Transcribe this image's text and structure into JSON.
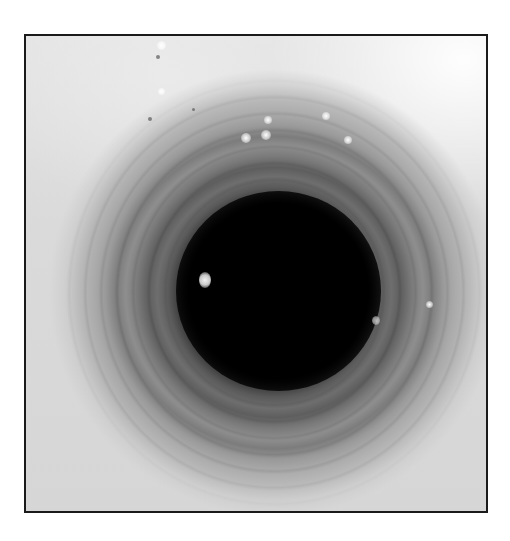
{
  "image": {
    "description": "Grayscale endoscopic view looking down a tubular lumen with concentric mucosal rings",
    "colors": {
      "border": "#1a1a1a",
      "lumen": "#000000",
      "mucosa_light": "#e6e6e6",
      "ring_mid": "#7a7a7a"
    }
  }
}
